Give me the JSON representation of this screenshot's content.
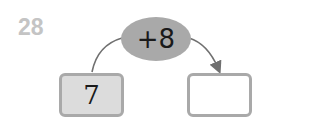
{
  "question_number": "28",
  "operation": {
    "label": "+8",
    "fill": "#a9a9a9"
  },
  "start_box": {
    "value": "7",
    "fill": "#dcdcdc"
  },
  "result_box": {
    "value": ""
  },
  "colors": {
    "border": "#a9a9a9",
    "arrow": "#707070",
    "number": "#c4c4c4"
  }
}
